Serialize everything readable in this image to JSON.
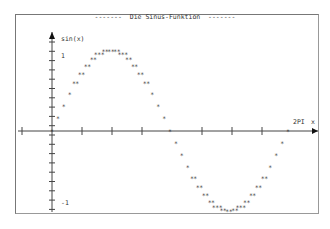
{
  "chart_data": {
    "type": "scatter",
    "title": "------- Die Sinus-Funktion -------",
    "xlabel": "x",
    "ylabel": "sin(x)",
    "x_tick_label_end": "2PI",
    "y_tick_labels": [
      "1",
      "-1"
    ],
    "xlim": [
      -0.9,
      6.7
    ],
    "ylim": [
      -1,
      1
    ],
    "grid": false,
    "legend": null,
    "rendering": "ASCII asterisks plotted on a coordinate cross",
    "series": [
      {
        "name": "sin(x)",
        "marker": "*",
        "x": [
          0,
          0.1571,
          0.3142,
          0.4712,
          0.6283,
          0.7854,
          0.9425,
          1.0996,
          1.2566,
          1.4137,
          1.5708,
          1.7279,
          1.885,
          2.042,
          2.1991,
          2.3562,
          2.5133,
          2.6704,
          2.8274,
          2.9845,
          3.1416,
          3.2987,
          3.4558,
          3.6128,
          3.7699,
          3.927,
          4.0841,
          4.2412,
          4.3982,
          4.5553,
          4.7124,
          4.8695,
          5.0265,
          5.1836,
          5.3407,
          5.4978,
          5.6549,
          5.8119,
          5.969,
          6.1261,
          6.2832
        ],
        "y": [
          0,
          0.156,
          0.309,
          0.454,
          0.588,
          0.707,
          0.809,
          0.891,
          0.951,
          0.988,
          1,
          0.988,
          0.951,
          0.891,
          0.809,
          0.707,
          0.588,
          0.454,
          0.309,
          0.156,
          0,
          -0.156,
          -0.309,
          -0.454,
          -0.588,
          -0.707,
          -0.809,
          -0.891,
          -0.951,
          -0.988,
          -1,
          -0.988,
          -0.951,
          -0.891,
          -0.809,
          -0.707,
          -0.588,
          -0.454,
          -0.309,
          -0.156,
          0
        ]
      }
    ]
  },
  "labels": {
    "title": "-------  Die Sinus-Funktion  -------",
    "y_axis": "sin(x)",
    "x_axis": "x",
    "x_end": "2PI",
    "y_top": "1",
    "y_bottom": "-1"
  }
}
